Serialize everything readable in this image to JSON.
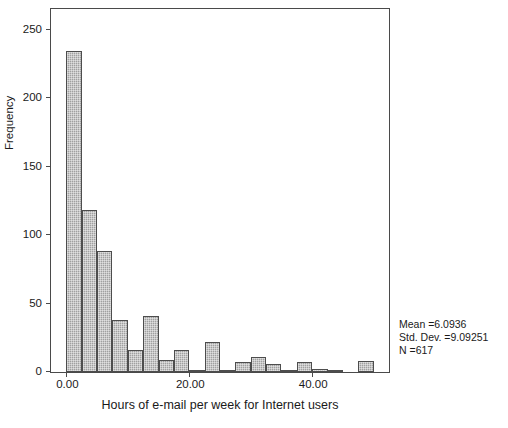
{
  "chart_data": {
    "type": "bar",
    "title": "",
    "subtitle": "",
    "xlabel": "Hours of e-mail per week for Internet users",
    "ylabel": "Frequency",
    "xlim": [
      -2.5,
      52.5
    ],
    "ylim": [
      0,
      265
    ],
    "grid": false,
    "legend": null,
    "bin_width": 2.5,
    "x_ticks": [
      {
        "value": 0,
        "label": "0.00"
      },
      {
        "value": 20,
        "label": "20.00"
      },
      {
        "value": 40,
        "label": "40.00"
      }
    ],
    "y_ticks": [
      {
        "value": 0,
        "label": "0"
      },
      {
        "value": 50,
        "label": "50"
      },
      {
        "value": 100,
        "label": "100"
      },
      {
        "value": 150,
        "label": "150"
      },
      {
        "value": 200,
        "label": "200"
      },
      {
        "value": 250,
        "label": "250"
      }
    ],
    "bin_centers": [
      1.25,
      3.75,
      6.25,
      8.75,
      11.25,
      13.75,
      16.25,
      18.75,
      21.25,
      23.75,
      26.25,
      28.75,
      31.25,
      33.75,
      36.25,
      38.75,
      41.25,
      43.75,
      46.25,
      48.75
    ],
    "bin_starts": [
      0,
      2.5,
      5,
      7.5,
      10,
      12.5,
      15,
      17.5,
      20,
      22.5,
      25,
      27.5,
      30,
      32.5,
      35,
      37.5,
      40,
      42.5,
      45,
      47.5
    ],
    "values": [
      234,
      118,
      88,
      38,
      16,
      41,
      9,
      16,
      1,
      22,
      1,
      7,
      11,
      6,
      1,
      7,
      2,
      1,
      0,
      8
    ],
    "annotations": [
      "Mean =6.0936",
      "Std. Dev. =9.09251",
      "N =617"
    ]
  },
  "stats": {
    "mean_line": "Mean =6.0936",
    "stddev_line": "Std. Dev. =9.09251",
    "n_line": "N =617"
  },
  "axes": {
    "x_title": "Hours of e-mail per week for Internet users",
    "y_title": "Frequency"
  },
  "colors": {
    "bar_fill": "#a0a0a0",
    "bar_border": "#4d4d4d",
    "frame": "#4a4a4a",
    "text": "#1a1a1a",
    "background": "#ffffff"
  }
}
